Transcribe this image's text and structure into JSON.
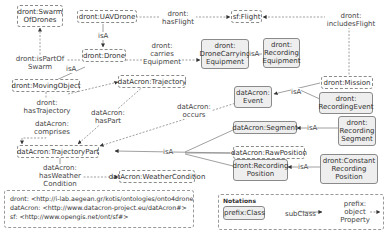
{
  "nodes": {
    "swarm": "dront:Swarm OfDrones",
    "uav": "dront:UAVDrone",
    "flight": "sf:Flight",
    "drone": "dront:Drone",
    "carrying": "dront: DroneCarrying Equipment",
    "recEquip": "dront: Recording Equipment",
    "moving": "dront:MovingObject",
    "trajectory": "datAcron:Trajectory",
    "mission": "dront:Mission",
    "event": "datAcron: Event",
    "recEvent": "dront: RecordingEvent",
    "trajPart": "datAcron:TrajectoryPart",
    "segment": "datAcron:Segment",
    "recSegment": "dront: Recording Segment",
    "rawPos": "datAcron:RawPosition",
    "recPos": "dront:Recording Position",
    "constRecPos": "dront:Constant Recording Position",
    "weather": "datAcron:WeatherCondition"
  },
  "edges": {
    "isPartOfSwarm": "dront:isPartOf Swarm",
    "hasFlight": "dront: hasFlight",
    "includesFlight": "dront: includesFlight",
    "carriesEquipment": "dront: carries Equipment",
    "hasTrajectory": "dront: hasTrajectory",
    "hasPart": "datAcron: hasPart",
    "comprises": "datAcron: comprises",
    "occurs": "datAcron: occurs",
    "hasWeatherCondition": "datAcron: hasWeather Condition",
    "isA": "isA"
  },
  "namespaces": [
    "dront:  <http://i-lab.aegean.gr/kotis/ontologies/onto4drone#>",
    "datAcron:  <http://www.datacron-project.eu/datAcron#>",
    "sf:  <http://www.opengis.net/ont/sf#>"
  ],
  "notations": {
    "title": "Notations",
    "class_example": "prefix:Class",
    "subclass_label": "subClass",
    "property_label": "prefix: object Property"
  }
}
